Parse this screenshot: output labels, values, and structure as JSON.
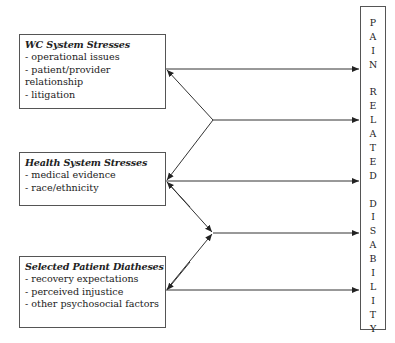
{
  "diagram": {
    "type": "flow-diagram",
    "sources": [
      {
        "id": "wc",
        "title": "WC System Stresses",
        "items": [
          "- operational issues",
          "- patient/provider",
          "relationship",
          "- litigation"
        ]
      },
      {
        "id": "hs",
        "title": "Health System Stresses",
        "items": [
          "- medical evidence",
          "- race/ethnicity"
        ]
      },
      {
        "id": "pd",
        "title": "Selected Patient Diatheses",
        "items": [
          "- recovery expectations",
          "- perceived injustice",
          "- other psychosocial factors"
        ]
      }
    ],
    "outcome": {
      "label": "PAIN RELATED DISABILITY",
      "letters": [
        "P",
        "A",
        "I",
        "N",
        "",
        "R",
        "E",
        "L",
        "A",
        "T",
        "E",
        "D",
        "",
        "D",
        "I",
        "S",
        "A",
        "B",
        "I",
        "L",
        "I",
        "T",
        "Y"
      ]
    },
    "edges": [
      {
        "from": "WC System Stresses",
        "to": "PAIN RELATED DISABILITY",
        "type": "direct-arrow"
      },
      {
        "from": "WC System Stresses x Health System Stresses",
        "to": "PAIN RELATED DISABILITY",
        "type": "interaction-fork"
      },
      {
        "from": "Health System Stresses",
        "to": "PAIN RELATED DISABILITY",
        "type": "direct-arrow"
      },
      {
        "from": "Health System Stresses x Selected Patient Diatheses",
        "to": "PAIN RELATED DISABILITY",
        "type": "interaction-fork"
      },
      {
        "from": "Selected Patient Diatheses",
        "to": "PAIN RELATED DISABILITY",
        "type": "direct-arrow"
      }
    ],
    "colors": {
      "line": "#333333",
      "border": "#555555",
      "text": "#222222",
      "background": "#ffffff"
    }
  }
}
